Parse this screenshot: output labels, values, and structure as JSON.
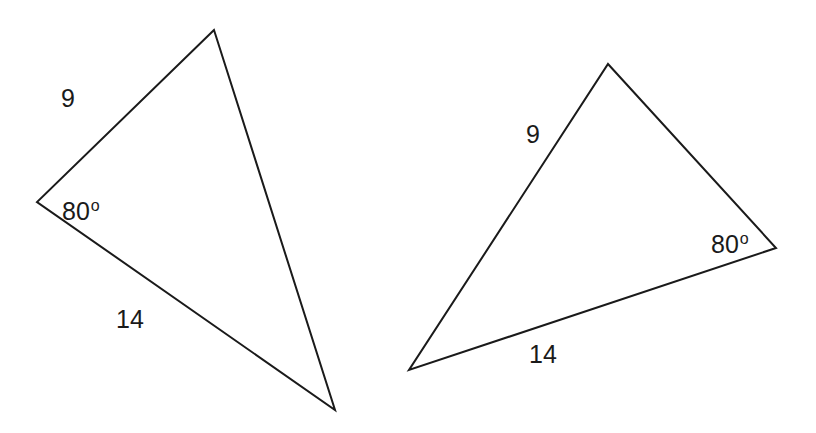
{
  "figure": {
    "stroke_color": "#1a1a1a",
    "background": "#ffffff"
  },
  "triangles": [
    {
      "id": "left",
      "side_a_label": "9",
      "side_b_label": "14",
      "angle_value": "80",
      "angle_unit": "o"
    },
    {
      "id": "right",
      "side_a_label": "9",
      "side_b_label": "14",
      "angle_value": "80",
      "angle_unit": "o"
    }
  ]
}
